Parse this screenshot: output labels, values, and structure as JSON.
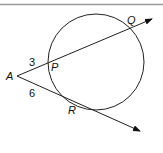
{
  "figure": {
    "colors": {
      "stroke": "#222222",
      "rule": "#9a9a9a",
      "background": "#ffffff"
    },
    "points": {
      "A": {
        "label": "A"
      },
      "P": {
        "label": "P"
      },
      "Q": {
        "label": "Q"
      },
      "R": {
        "label": "R"
      }
    },
    "segments": {
      "AP": {
        "length_label": "3"
      },
      "AR": {
        "length_label": "6"
      }
    }
  }
}
